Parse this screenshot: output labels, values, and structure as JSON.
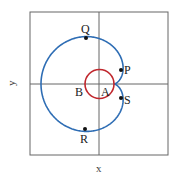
{
  "diagram": {
    "type": "polar-curves",
    "axis_labels": {
      "x": "x",
      "y": "y"
    },
    "curves": [
      {
        "name": "cardioid",
        "color": "#2e6db4"
      },
      {
        "name": "circle",
        "color": "#c0272d"
      }
    ],
    "points": [
      {
        "label": "Q"
      },
      {
        "label": "P"
      },
      {
        "label": "S"
      },
      {
        "label": "R"
      }
    ],
    "region_labels": [
      {
        "label": "A"
      },
      {
        "label": "B"
      }
    ]
  }
}
